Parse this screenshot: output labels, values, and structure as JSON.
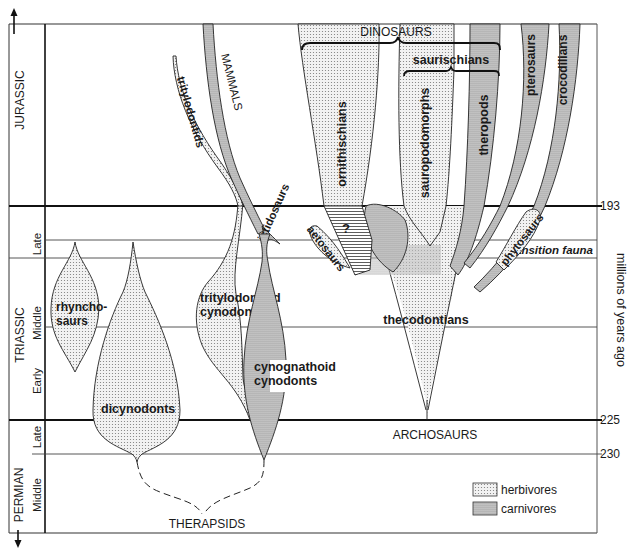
{
  "diagram": {
    "periods": [
      {
        "name": "JURASSIC"
      },
      {
        "name": "TRIASSIC",
        "epochs": [
          "Late",
          "Middle",
          "Early"
        ]
      },
      {
        "name": "PERMIAN",
        "epochs": [
          "Late",
          "Middle"
        ]
      }
    ],
    "time_axis": {
      "label": "millions of years ago",
      "ticks": [
        "193",
        "225",
        "230"
      ]
    },
    "band_label": "transition fauna",
    "groups": {
      "dinosaurs": "DINOSAURS",
      "saurischians": "saurischians",
      "archosaurs": "ARCHOSAURS",
      "therapsids": "THERAPSIDS",
      "mammals": "MAMMALS"
    },
    "lineages": {
      "ornithischians": "ornithischians",
      "sauropodomorphs": "sauropodomorphs",
      "theropods": "theropods",
      "pterosaurs": "pterosaurs",
      "crocodilians": "crocodilians",
      "tritylodontids": "tritylodontids",
      "ictidosaurs": "ictidosaurs",
      "aetosaurs": "aetosaurs",
      "phytosaurs": "phytosaurs",
      "unknown": "?",
      "thecodontians": "thecodontians",
      "rhynchosaurs_1": "rhyncho-",
      "rhynchosaurs_2": "saurs",
      "tritylodontoid_1": "tritylodontoid",
      "tritylodontoid_2": "cynodonts",
      "cynognathoid_1": "cynognathoid",
      "cynognathoid_2": "cynodonts",
      "dicynodonts": "dicynodonts"
    },
    "legend": [
      {
        "label": "herbivores",
        "pattern": "light-dots"
      },
      {
        "label": "carnivores",
        "pattern": "dense-dots"
      }
    ],
    "colors": {
      "ink": "#1a1a1a",
      "herbivore_fill": "#e4e4e4",
      "carnivore_fill": "#c4c4c4",
      "background": "#ffffff"
    }
  }
}
